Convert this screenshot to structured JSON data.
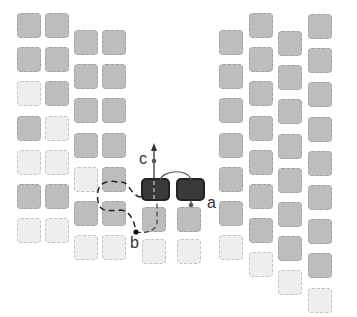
{
  "colors": {
    "gray": "#bdbdbd",
    "light": "#eeeeee",
    "dark": "#3a3a3a",
    "line": "#333333"
  },
  "clusters": [
    {
      "name": "left-cluster",
      "columns": [
        {
          "x": 17,
          "y0": 13,
          "step": 34.2,
          "cells": [
            "gray",
            "gray",
            "light",
            "gray",
            "light",
            "gray",
            "light"
          ]
        },
        {
          "x": 45,
          "y0": 13,
          "step": 34.2,
          "cells": [
            "gray",
            "gray",
            "gray",
            "light",
            "light",
            "gray",
            "light"
          ]
        },
        {
          "x": 74,
          "y0": 30,
          "step": 34.2,
          "cells": [
            "gray",
            "gray",
            "gray",
            "gray",
            "light",
            "gray",
            "light"
          ]
        },
        {
          "x": 102,
          "y0": 30,
          "step": 34.2,
          "cells": [
            "gray",
            "gray",
            "gray",
            "gray",
            "gray",
            "gray",
            "light"
          ]
        }
      ]
    },
    {
      "name": "right-cluster",
      "columns": [
        {
          "x": 219,
          "y0": 30,
          "step": 34.2,
          "cells": [
            "gray",
            "gray",
            "gray",
            "gray",
            "gray",
            "gray",
            "light"
          ]
        },
        {
          "x": 249,
          "y0": 13,
          "step": 34.2,
          "cells": [
            "gray",
            "gray",
            "gray",
            "gray",
            "gray",
            "gray",
            "gray",
            "light"
          ]
        },
        {
          "x": 278,
          "y0": 31,
          "step": 34.2,
          "cells": [
            "gray",
            "gray",
            "gray",
            "gray",
            "gray",
            "gray",
            "gray",
            "light"
          ]
        },
        {
          "x": 308,
          "y0": 14,
          "step": 34.2,
          "cells": [
            "gray",
            "gray",
            "gray",
            "gray",
            "gray",
            "gray",
            "gray",
            "gray",
            "light"
          ]
        }
      ]
    },
    {
      "name": "center-cluster",
      "columns": [
        {
          "x": 142,
          "y0": 207,
          "step": 32,
          "cells": [
            "gray",
            "light"
          ]
        },
        {
          "x": 177,
          "y0": 207,
          "step": 32,
          "cells": [
            "gray",
            "light"
          ]
        }
      ]
    }
  ],
  "dark_blocks": [
    {
      "x": 141,
      "y": 178
    },
    {
      "x": 176,
      "y": 178
    }
  ],
  "labels": {
    "a": "a",
    "b": "b",
    "c": "c"
  }
}
